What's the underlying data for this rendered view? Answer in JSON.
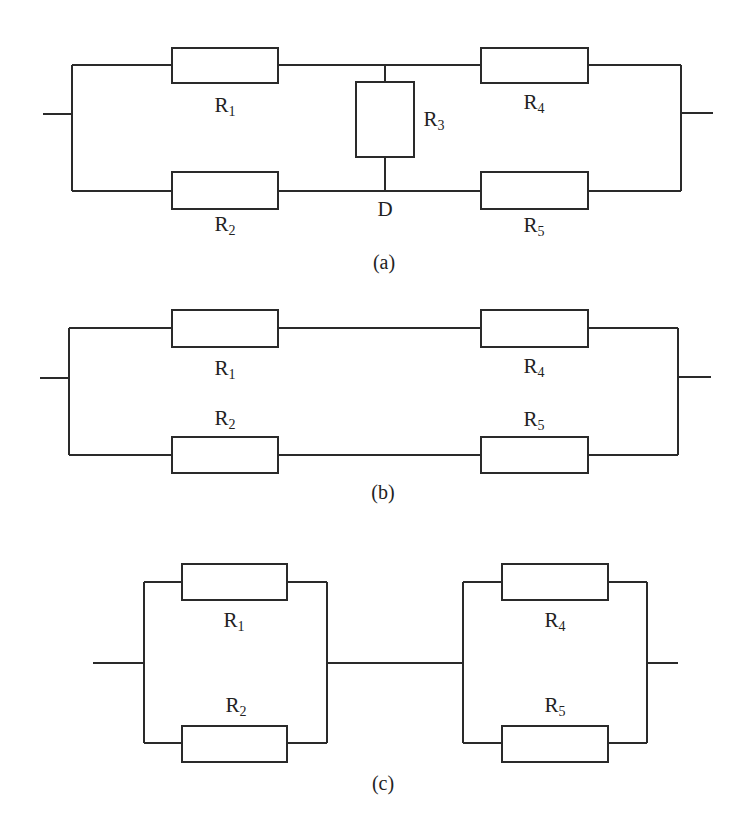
{
  "figure": {
    "panels": [
      {
        "caption": "(a)",
        "description": "Bridge circuit: R1 and R2 in parallel branches, R4 and R5 in parallel branches, bridged by R3 between top node and node D",
        "resistors": [
          {
            "id": "R1",
            "base": "R",
            "sub": "1"
          },
          {
            "id": "R2",
            "base": "R",
            "sub": "2"
          },
          {
            "id": "R3",
            "base": "R",
            "sub": "3"
          },
          {
            "id": "R4",
            "base": "R",
            "sub": "4"
          },
          {
            "id": "R5",
            "base": "R",
            "sub": "5"
          }
        ],
        "node_label": "D"
      },
      {
        "caption": "(b)",
        "description": "R3 removed: series R1-R4 in parallel with series R2-R5",
        "resistors": [
          {
            "id": "R1",
            "base": "R",
            "sub": "1"
          },
          {
            "id": "R2",
            "base": "R",
            "sub": "2"
          },
          {
            "id": "R4",
            "base": "R",
            "sub": "4"
          },
          {
            "id": "R5",
            "base": "R",
            "sub": "5"
          }
        ]
      },
      {
        "caption": "(c)",
        "description": "R3 shorted: (R1 || R2) in series with (R4 || R5)",
        "resistors": [
          {
            "id": "R1",
            "base": "R",
            "sub": "1"
          },
          {
            "id": "R2",
            "base": "R",
            "sub": "2"
          },
          {
            "id": "R4",
            "base": "R",
            "sub": "4"
          },
          {
            "id": "R5",
            "base": "R",
            "sub": "5"
          }
        ]
      }
    ],
    "colors": {
      "line": "#2a2a2a",
      "background": "#ffffff",
      "text": "#222222"
    }
  }
}
